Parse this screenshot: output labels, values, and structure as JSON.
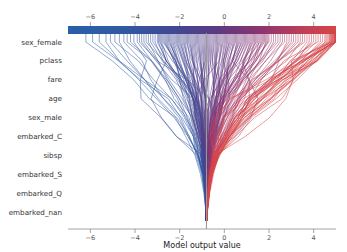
{
  "chart_data": {
    "type": "line",
    "plot_kind": "shap-decision-plot",
    "title": "",
    "xlabel": "Model output value",
    "ylabel": "",
    "xlim": [
      -7.0,
      5.0
    ],
    "xticks": [
      -6,
      -4,
      -2,
      0,
      2,
      4
    ],
    "xticklabels": [
      "−6",
      "−4",
      "−2",
      "0",
      "2",
      "4"
    ],
    "grid": false,
    "legend": null,
    "base_value": -0.8,
    "features_top_to_bottom": [
      "sex_female",
      "pclass",
      "fare",
      "age",
      "sex_male",
      "embarked_C",
      "sibsp",
      "embarked_S",
      "embarked_Q",
      "embarked_nan"
    ],
    "colorbar": {
      "position": "top",
      "orientation": "horizontal",
      "vmin": -7.0,
      "vmax": 5.0,
      "ticks": [
        -6,
        -4,
        -2,
        0,
        2,
        4
      ],
      "ticklabels": [
        "−6",
        "−4",
        "−2",
        "0",
        "2",
        "4"
      ],
      "cmap": "shap_red_blue",
      "color_low": "#2b5fa8",
      "color_mid": "#5a3a82",
      "color_high": "#d64545"
    },
    "line_colors": {
      "blue": "#2b5fa8",
      "purple": "#5a3a82",
      "red": "#d64545",
      "reference_line": "#999999"
    },
    "n_lines": 170,
    "series_endpoints_top": [
      -6.2,
      -5.9,
      -5.6,
      -5.3,
      -5.1,
      -4.9,
      -4.7,
      -4.5,
      -4.35,
      -4.2,
      -4.05,
      -3.9,
      -3.8,
      -3.7,
      -3.6,
      -3.5,
      -3.4,
      -3.3,
      -3.2,
      -3.1,
      -3.0,
      -2.95,
      -2.9,
      -2.85,
      -2.8,
      -2.75,
      -2.7,
      -2.65,
      -2.6,
      -2.55,
      -2.5,
      -2.45,
      -2.4,
      -2.35,
      -2.3,
      -2.25,
      -2.2,
      -2.15,
      -2.1,
      -2.05,
      -2.0,
      -1.95,
      -1.9,
      -1.85,
      -1.8,
      -1.75,
      -1.7,
      -1.65,
      -1.6,
      -1.55,
      -1.5,
      -1.45,
      -1.4,
      -1.35,
      -1.3,
      -1.25,
      -1.2,
      -1.15,
      -1.1,
      -1.05,
      -1.0,
      -0.95,
      -0.9,
      -0.85,
      -0.8,
      -0.75,
      -0.7,
      -0.65,
      -0.6,
      -0.55,
      -0.5,
      -0.45,
      -0.4,
      -0.35,
      -0.3,
      -0.25,
      -0.2,
      -0.15,
      -0.1,
      -0.05,
      0.0,
      0.05,
      0.1,
      0.15,
      0.2,
      0.25,
      0.3,
      0.35,
      0.4,
      0.45,
      0.5,
      0.55,
      0.6,
      0.65,
      0.7,
      0.75,
      0.8,
      0.85,
      0.9,
      0.95,
      1.0,
      1.05,
      1.1,
      1.15,
      1.2,
      1.25,
      1.3,
      1.35,
      1.4,
      1.45,
      1.5,
      1.55,
      1.6,
      1.65,
      1.7,
      1.75,
      1.8,
      1.85,
      1.9,
      1.95,
      2.0,
      2.1,
      2.2,
      2.3,
      2.4,
      2.5,
      2.6,
      2.7,
      2.8,
      2.9,
      3.0,
      3.1,
      3.2,
      3.3,
      3.4,
      3.5,
      3.6,
      3.7,
      3.8,
      3.9,
      4.0,
      4.1,
      4.2,
      4.3,
      4.4,
      4.5,
      4.55,
      4.6,
      4.65,
      4.7,
      4.72,
      4.75,
      4.78,
      4.8,
      4.82,
      4.84,
      4.86,
      4.88,
      4.9,
      4.92,
      4.93,
      4.94,
      4.95,
      4.96,
      4.97,
      4.975,
      4.98,
      4.985,
      4.99,
      4.995
    ]
  }
}
